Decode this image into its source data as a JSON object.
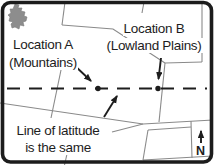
{
  "diagram": {
    "background_color": "#ffffff",
    "frame_color": "#1c1c1c",
    "boundary_line_color": "#8a8a8a",
    "ink_color": "#1d1d1d",
    "lake_color": "#8d8d8d"
  },
  "annotations": {
    "location_a": {
      "line1": "Location A",
      "line2": "(Mountains)"
    },
    "location_b": {
      "line1": "Location B",
      "line2": "(Lowland Plains)"
    },
    "latitude_note": {
      "line1": "Line of latitude",
      "line2": "is the same"
    },
    "compass": {
      "label": "N"
    }
  },
  "map": {
    "latitude_line": {
      "y": 88,
      "x1": 7,
      "x2": 207,
      "style": "dashed"
    },
    "points": [
      {
        "label": "Location A",
        "x": 98,
        "y": 88
      },
      {
        "label": "Location B",
        "x": 158,
        "y": 88
      }
    ]
  }
}
